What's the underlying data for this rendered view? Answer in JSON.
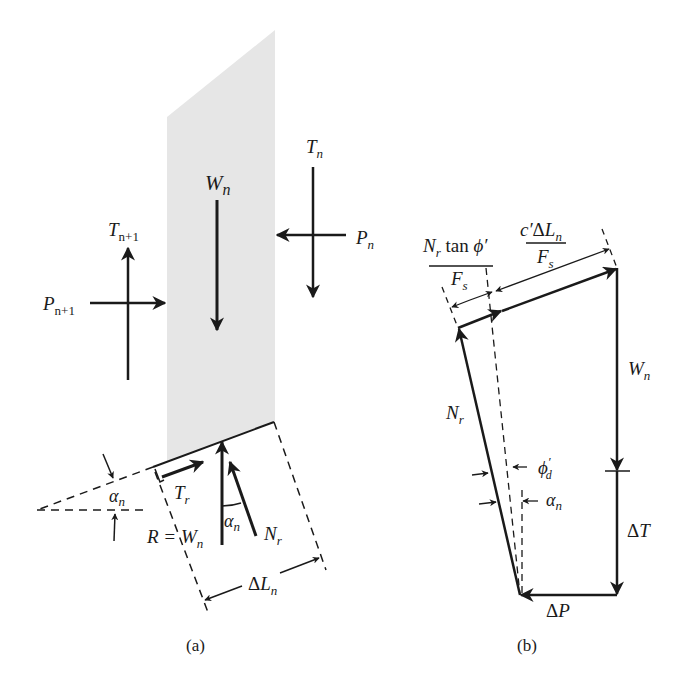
{
  "figure": {
    "colors": {
      "ink": "#1a1a1a",
      "slice_fill": "#e6e6e6",
      "background": "#ffffff"
    },
    "panel_a": {
      "caption": "(a)",
      "labels": {
        "Wn": "W",
        "Wn_sub": "n",
        "Tn": "T",
        "Tn_sub": "n",
        "Pn": "P",
        "Pn_sub": "n",
        "Tn1": "T",
        "Tn1_sub": "n+1",
        "Pn1": "P",
        "Pn1_sub": "n+1",
        "Tr": "T",
        "Tr_sub": "r",
        "Nr": "N",
        "Nr_sub": "r",
        "alpha_base": "α",
        "alpha_base_sub": "n",
        "alpha_angle": "α",
        "alpha_angle_sub": "n",
        "R_eq": "R = W",
        "R_eq_sub": "n",
        "dLn_delta": "Δ",
        "dLn": "L",
        "dLn_sub": "n"
      }
    },
    "panel_b": {
      "caption": "(b)",
      "labels": {
        "Nr_tan_num_N": "N",
        "Nr_tan_num_sub": "r",
        "Nr_tan_num_rest": " tan ",
        "Nr_tan_phi": "ϕ′",
        "Nr_tan_den": "F",
        "Nr_tan_den_sub": "s",
        "c_num_c": "c′",
        "c_num_delta": "Δ",
        "c_num_L": "L",
        "c_num_sub": "n",
        "c_den": "F",
        "c_den_sub": "s",
        "Wn": "W",
        "Wn_sub": "n",
        "Nr": "N",
        "Nr_sub": "r",
        "phi_d": "ϕ",
        "phi_d_sub": "d",
        "phi_d_prime": "′",
        "alpha": "α",
        "alpha_sub": "n",
        "dT_delta": "Δ",
        "dT": "T",
        "dP_delta": "Δ",
        "dP": "P"
      }
    }
  }
}
